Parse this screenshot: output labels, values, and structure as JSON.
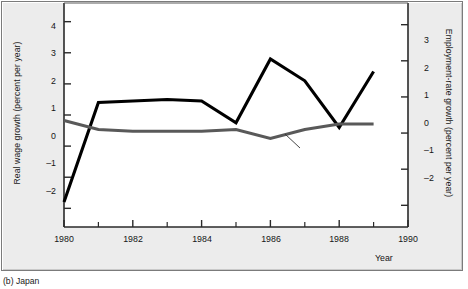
{
  "figure": {
    "caption": "(b)  Japan",
    "background": "#ececec",
    "plot_background": "#ffffff"
  },
  "chart_data": {
    "type": "line",
    "title": "",
    "subtitle": "",
    "xlabel": "Year",
    "ylabel": "Real wage growth (percent per year)",
    "y2label": "Employment-rate growth (percent per year)",
    "x": [
      1980,
      1981,
      1982,
      1983,
      1984,
      1985,
      1986,
      1987,
      1988,
      1989
    ],
    "xlim": [
      1980,
      1990
    ],
    "xticks": [
      1980,
      1982,
      1984,
      1986,
      1988,
      1990
    ],
    "xticklabels": [
      "1980",
      "1982",
      "1984",
      "1986",
      "1988",
      "1990"
    ],
    "xminorticks": [
      1981,
      1983,
      1985,
      1987,
      1989
    ],
    "ylim": [
      -2.6,
      4.6
    ],
    "yticks": [
      -2,
      -1,
      0,
      1,
      2,
      3,
      4
    ],
    "yticklabels": [
      "–2",
      "–1",
      "0",
      "1",
      "2",
      "3",
      "4"
    ],
    "y2lim": [
      -2.6,
      3.6
    ],
    "y2ticks": [
      -2,
      -1,
      0,
      1,
      2,
      3
    ],
    "y2ticklabels": [
      "–2",
      "–1",
      "0",
      "1",
      "2",
      "3"
    ],
    "grid": false,
    "legend_position": "inline-annotation",
    "series": [
      {
        "name": "Real wage",
        "axis": "left",
        "color": "#000000",
        "linewidth": 3.1,
        "values": [
          -1.8,
          1.4,
          1.45,
          1.5,
          1.45,
          0.75,
          2.8,
          2.1,
          0.6,
          2.4
        ]
      },
      {
        "name": "Employment rate",
        "axis": "right",
        "color": "#595959",
        "linewidth": 3.1,
        "values": [
          0.35,
          0.1,
          0.05,
          0.05,
          0.05,
          0.1,
          -0.15,
          0.1,
          0.25,
          0.25
        ]
      }
    ],
    "annotations": [
      {
        "text": "Real wage",
        "series": "Real wage",
        "leader": false
      },
      {
        "text": "Employment rate",
        "series": "Employment rate",
        "leader": true
      }
    ]
  },
  "axes": {
    "left_title": "Real wage growth (percent per year)",
    "right_title": "Employment-rate growth (percent per year)",
    "x_title": "Year"
  }
}
